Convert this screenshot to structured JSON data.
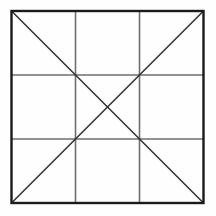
{
  "figure": {
    "kind": "geometric-line-drawing",
    "canvas": {
      "width": 216,
      "height": 216,
      "background_color": "#fefefe"
    },
    "square": {
      "label": "outer-square",
      "left": 11.5,
      "top": 11.0,
      "right": 203.5,
      "bottom": 203.0,
      "width": 192.0,
      "height": 192.0,
      "stroke_color": "#1a1a1a",
      "stroke_width": 2.4
    },
    "grid": {
      "label": "3x3-grid",
      "rows": 3,
      "columns": 3,
      "cells": 9,
      "stroke_color": "#6e6e6e",
      "stroke_width": 1.6,
      "vertical_lines": [
        {
          "label": "vertical-line-1",
          "x": 75.5
        },
        {
          "label": "vertical-line-2",
          "x": 139.5
        }
      ],
      "horizontal_lines": [
        {
          "label": "horizontal-line-1",
          "y": 75.0
        },
        {
          "label": "horizontal-line-2",
          "y": 139.0
        }
      ]
    },
    "diagonals": {
      "label": "diagonal-pair",
      "count": 2,
      "stroke_color": "#2b2b2b",
      "stroke_width": 1.5,
      "lines": [
        {
          "label": "diagonal-main",
          "description": "top-left to bottom-right",
          "x1": 11.5,
          "y1": 11.0,
          "x2": 203.5,
          "y2": 203.0
        },
        {
          "label": "diagonal-anti",
          "description": "top-right to bottom-left",
          "x1": 203.5,
          "y1": 11.0,
          "x2": 11.5,
          "y2": 203.0
        }
      ],
      "intersection": {
        "label": "center-point",
        "x": 107.5,
        "y": 107.0
      }
    },
    "vertices": [
      {
        "label": "corner-top-left",
        "x": 11.5,
        "y": 11.0
      },
      {
        "label": "corner-top-right",
        "x": 203.5,
        "y": 11.0
      },
      {
        "label": "corner-bottom-right",
        "x": 203.5,
        "y": 203.0
      },
      {
        "label": "corner-bottom-left",
        "x": 11.5,
        "y": 203.0
      }
    ],
    "grid_intersections": [
      {
        "label": "node-1-1",
        "x": 75.5,
        "y": 75.0
      },
      {
        "label": "node-2-1",
        "x": 139.5,
        "y": 75.0
      },
      {
        "label": "node-1-2",
        "x": 75.5,
        "y": 139.0
      },
      {
        "label": "node-2-2",
        "x": 139.5,
        "y": 139.0
      }
    ]
  }
}
